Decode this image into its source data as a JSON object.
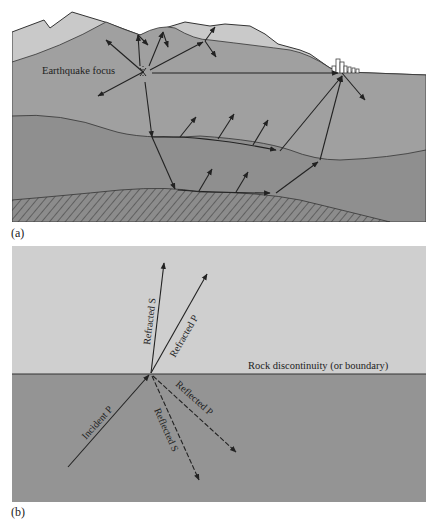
{
  "figure": {
    "panel_a": {
      "label": "(a)",
      "focus_label": "Earthquake focus",
      "colors": {
        "surface_layer": "#c9c9c9",
        "upper_crust": "#a0a0a0",
        "middle_layer": "#8f8f8f",
        "deep_layer": "#8b8b8b",
        "line": "#222222",
        "buildings": "#ffffff"
      }
    },
    "panel_b": {
      "label": "(b)",
      "boundary_label": "Rock discontinuity (or boundary)",
      "arrows": [
        {
          "name": "Incident P",
          "style": "solid"
        },
        {
          "name": "Refracted S",
          "style": "solid"
        },
        {
          "name": "Refracted P",
          "style": "solid"
        },
        {
          "name": "Reflected S",
          "style": "dashed"
        },
        {
          "name": "Reflected P",
          "style": "dashed"
        }
      ],
      "colors": {
        "upper_medium": "#cfcfcf",
        "lower_medium": "#949494",
        "boundary_line": "#333333"
      }
    }
  }
}
